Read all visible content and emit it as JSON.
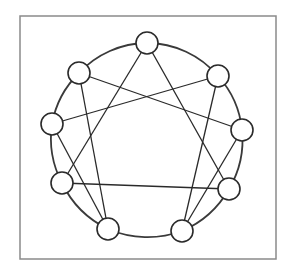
{
  "diagram": {
    "type": "enneagram",
    "frame": {
      "x": 20,
      "y": 16,
      "width": 256,
      "height": 243,
      "stroke": "#8a8a8a"
    },
    "circle": {
      "cx": 147,
      "cy": 137,
      "stroke": "#3a3a3a"
    },
    "node_radius": 11,
    "node_fill": "#ffffff",
    "node_stroke": "#2a2a2a",
    "line_stroke": "#2a2a2a",
    "nodes": [
      {
        "id": "top",
        "x": 147,
        "y": 43
      },
      {
        "id": "upper-right",
        "x": 218,
        "y": 76
      },
      {
        "id": "right",
        "x": 242,
        "y": 130
      },
      {
        "id": "lower-right",
        "x": 229,
        "y": 189
      },
      {
        "id": "bottom-right",
        "x": 182,
        "y": 231
      },
      {
        "id": "bottom-left",
        "x": 108,
        "y": 229
      },
      {
        "id": "lower-left",
        "x": 62,
        "y": 183
      },
      {
        "id": "left",
        "x": 52,
        "y": 124
      },
      {
        "id": "upper-left",
        "x": 79,
        "y": 73
      }
    ],
    "edges": [
      [
        "top",
        "lower-left"
      ],
      [
        "top",
        "lower-right"
      ],
      [
        "lower-left",
        "lower-right"
      ],
      [
        "upper-left",
        "right"
      ],
      [
        "upper-left",
        "bottom-left"
      ],
      [
        "left",
        "upper-right"
      ],
      [
        "left",
        "bottom-left"
      ],
      [
        "upper-right",
        "bottom-right"
      ],
      [
        "right",
        "bottom-right"
      ]
    ]
  }
}
